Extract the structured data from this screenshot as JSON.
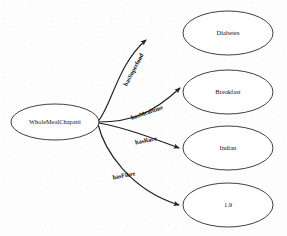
{
  "diagram": {
    "type": "ontology-graph",
    "subject": {
      "id": "whole-meal-chapatti",
      "label": "WholeMealChapatti",
      "shape": "ellipse",
      "cx": 55,
      "cy": 122,
      "rx": 44,
      "ry": 18
    },
    "objects": [
      {
        "id": "diabetes",
        "label": "Diabetes",
        "shape": "ellipse",
        "cx": 228,
        "cy": 33,
        "rx": 45,
        "ry": 22
      },
      {
        "id": "breakfast",
        "label": "Breakfast",
        "shape": "ellipse",
        "cx": 228,
        "cy": 92,
        "rx": 45,
        "ry": 22
      },
      {
        "id": "indian",
        "label": "Indian",
        "shape": "ellipse",
        "cx": 228,
        "cy": 148,
        "rx": 45,
        "ry": 22
      },
      {
        "id": "fibre-value",
        "label": "1.9",
        "shape": "ellipse",
        "cx": 228,
        "cy": 205,
        "rx": 45,
        "ry": 22
      }
    ],
    "edges": [
      {
        "id": "edge-has-superfood",
        "label": "hasSuperfood",
        "from": "whole-meal-chapatti",
        "to": "diabetes",
        "label_x": 134,
        "label_y": 70,
        "label_rotation": -62
      },
      {
        "id": "edge-has-mealtime",
        "label": "hasMealtime",
        "from": "whole-meal-chapatti",
        "to": "breakfast",
        "label_x": 147,
        "label_y": 113,
        "label_rotation": -19
      },
      {
        "id": "edge-has-race",
        "label": "hasRace",
        "from": "whole-meal-chapatti",
        "to": "indian",
        "label_x": 146,
        "label_y": 141,
        "label_rotation": -11
      },
      {
        "id": "edge-has-fibre",
        "label": "hasFibre",
        "from": "whole-meal-chapatti",
        "to": "fibre-value",
        "label_x": 124,
        "label_y": 176,
        "label_rotation": -10
      }
    ],
    "colors": {
      "node_stroke": "#2b2b2b",
      "node_fill": "#ffffff",
      "edge_stroke": "#1f1f1f",
      "text": "#141414",
      "background": "#fdfdfd"
    }
  }
}
